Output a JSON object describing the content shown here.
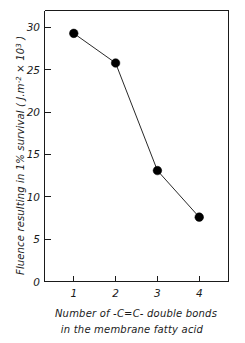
{
  "chart_data": {
    "type": "line",
    "title": "",
    "xlabel": "Number of -C=C- double bonds in the membrane fatty acid",
    "ylabel": "Fluence resulting in 1% survival (J.m-2 x103)",
    "x": [
      1,
      2,
      3,
      4
    ],
    "values": [
      29.3,
      25.8,
      13.1,
      7.6
    ],
    "series": [
      {
        "name": "Fluence at 1% survival",
        "values": [
          29.3,
          25.8,
          13.1,
          7.6
        ],
        "marker": "filled-circle",
        "color": "#000000"
      }
    ],
    "xlim": [
      0.3,
      4.7
    ],
    "ylim": [
      0,
      32
    ],
    "xticks": [
      1,
      2,
      3,
      4
    ],
    "yticks": [
      0,
      5,
      10,
      15,
      20,
      25,
      30
    ],
    "grid": false,
    "legend": false
  },
  "axes": {
    "y_tick_labels": [
      "30",
      "25",
      "20",
      "15",
      "10",
      "5",
      "0"
    ],
    "x_tick_labels": [
      "1",
      "2",
      "3",
      "4"
    ],
    "y_title": {
      "part1": "Fluence resulting in 1% survival  ( J.m",
      "exp1": "-2",
      "part2": " × 10",
      "exp2": "3",
      "part3": " )"
    },
    "x_caption": {
      "line1": "Number  of  -C=C-  double  bonds",
      "line2": "in the membrane  fatty  acid"
    }
  },
  "colors": {
    "axis": "#1a1a1a",
    "marker": "#000000",
    "line": "#111111",
    "background": "#ffffff"
  }
}
